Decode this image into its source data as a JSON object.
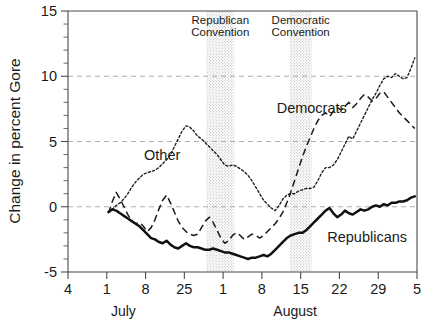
{
  "chart_data": {
    "type": "line",
    "title": "",
    "xlabel": "",
    "ylabel": "Change in percent Gore",
    "ylim": [
      -5,
      15
    ],
    "yticks": [
      -5,
      0,
      5,
      10,
      15
    ],
    "yticklabels": [
      "-5",
      "0",
      "5",
      "10",
      "15"
    ],
    "y_minor_step": 1,
    "grid": "horizontal-dashed at 0, 5, 10",
    "gridlines": [
      0,
      5,
      10
    ],
    "legend_position": "inline-annotations",
    "xticklabels": [
      "4",
      "1",
      "8",
      "25",
      "1",
      "8",
      "15",
      "22",
      "29",
      "5"
    ],
    "xtick_days": [
      4,
      11,
      18,
      25,
      32,
      39,
      46,
      53,
      60,
      67
    ],
    "xlim_days": [
      4,
      67
    ],
    "month_labels": [
      {
        "text": "July",
        "at_day": 14
      },
      {
        "text": "August",
        "at_day": 45
      }
    ],
    "annotations": [
      {
        "name": "republican-convention",
        "lines": [
          "Republican",
          "Convention"
        ],
        "band_start_day": 29,
        "band_end_day": 34,
        "shading": "stippled"
      },
      {
        "name": "democratic-convention",
        "lines": [
          "Democratic",
          "Convention"
        ],
        "band_start_day": 44,
        "band_end_day": 48,
        "shading": "stippled"
      }
    ],
    "series": [
      {
        "name": "Other",
        "style": "dotted",
        "label_at": {
          "day": 21,
          "value": 4.0
        },
        "x": [
          11.3,
          12.0,
          12.7,
          13.4,
          14.1,
          14.8,
          15.5,
          16.2,
          16.9,
          17.6,
          18.3,
          19.0,
          19.7,
          20.4,
          21.1,
          21.8,
          22.5,
          23.2,
          23.9,
          24.6,
          25.3,
          26.0,
          26.7,
          27.4,
          28.1,
          28.8,
          29.5,
          30.2,
          30.9,
          31.6,
          32.3,
          33.0,
          33.7,
          34.4,
          35.1,
          35.8,
          36.5,
          37.2,
          37.9,
          38.6,
          39.3,
          40.0,
          40.7,
          41.4,
          42.1,
          42.8,
          43.5,
          44.2,
          44.9,
          45.6,
          46.3,
          47.0,
          47.7,
          48.4,
          49.1,
          49.8,
          50.5,
          51.2,
          51.9,
          52.6,
          53.3,
          54.0,
          54.7,
          55.4,
          56.1,
          56.8,
          57.5,
          58.2,
          58.9,
          59.6,
          60.3,
          61.0,
          61.7,
          62.4,
          63.1,
          63.8,
          64.5,
          65.2,
          65.9,
          66.6
        ],
        "y": [
          -0.4,
          -0.2,
          0.1,
          0.3,
          0.6,
          1.0,
          1.5,
          1.9,
          2.2,
          2.5,
          2.6,
          2.7,
          2.8,
          3.0,
          3.3,
          3.6,
          4.0,
          4.6,
          5.2,
          5.8,
          6.2,
          6.1,
          5.8,
          5.4,
          5.2,
          4.9,
          4.6,
          4.3,
          4.0,
          3.6,
          3.2,
          3.1,
          3.2,
          3.1,
          2.9,
          2.7,
          2.4,
          2.0,
          1.5,
          1.0,
          0.5,
          0.2,
          -0.1,
          -0.3,
          0.1,
          0.6,
          0.9,
          1.0,
          1.0,
          1.2,
          1.3,
          1.4,
          1.4,
          1.5,
          2.0,
          2.6,
          3.0,
          3.0,
          3.2,
          3.6,
          4.2,
          4.8,
          5.4,
          5.2,
          5.8,
          6.4,
          7.0,
          7.6,
          8.2,
          8.7,
          9.3,
          9.8,
          10.0,
          9.9,
          10.2,
          10.0,
          9.8,
          9.9,
          10.6,
          11.4
        ]
      },
      {
        "name": "Democrats",
        "style": "dashed",
        "label_at": {
          "day": 48,
          "value": 7.6
        },
        "x": [
          11.3,
          12.0,
          12.7,
          13.4,
          14.1,
          14.8,
          15.5,
          16.2,
          16.9,
          17.6,
          18.3,
          19.0,
          19.7,
          20.4,
          21.1,
          21.8,
          22.5,
          23.2,
          23.9,
          24.6,
          25.3,
          26.0,
          26.7,
          27.4,
          28.1,
          28.8,
          29.5,
          30.2,
          30.9,
          31.6,
          32.3,
          33.0,
          33.7,
          34.4,
          35.1,
          35.8,
          36.5,
          37.2,
          37.9,
          38.6,
          39.3,
          40.0,
          40.7,
          41.4,
          42.1,
          42.8,
          43.5,
          44.2,
          44.9,
          45.6,
          46.3,
          47.0,
          47.7,
          48.4,
          49.1,
          49.8,
          50.5,
          51.2,
          51.9,
          52.6,
          53.3,
          54.0,
          54.7,
          55.4,
          56.1,
          56.8,
          57.5,
          58.2,
          58.9,
          59.6,
          60.3,
          61.0,
          61.7,
          62.4,
          63.1,
          63.8,
          64.5,
          65.2,
          65.9,
          66.6
        ],
        "y": [
          -0.5,
          0.4,
          1.1,
          0.6,
          0.0,
          -0.6,
          -1.1,
          -1.3,
          -1.2,
          -1.5,
          -1.9,
          -1.6,
          -1.0,
          -0.2,
          0.5,
          0.9,
          0.3,
          -0.4,
          -1.1,
          -1.6,
          -1.9,
          -2.1,
          -2.2,
          -2.1,
          -1.6,
          -1.1,
          -0.8,
          -1.2,
          -1.8,
          -2.4,
          -2.8,
          -2.6,
          -2.2,
          -2.0,
          -2.2,
          -2.5,
          -2.3,
          -2.1,
          -2.2,
          -2.4,
          -2.2,
          -1.9,
          -1.6,
          -1.3,
          -0.9,
          -0.4,
          0.3,
          1.1,
          2.0,
          2.9,
          3.8,
          4.6,
          5.3,
          6.0,
          6.6,
          7.0,
          7.2,
          6.9,
          7.3,
          7.6,
          7.4,
          7.7,
          8.0,
          7.6,
          7.9,
          8.3,
          8.6,
          8.4,
          8.1,
          8.3,
          8.7,
          8.8,
          8.4,
          8.0,
          7.6,
          7.2,
          6.9,
          6.6,
          6.3,
          6.0
        ]
      },
      {
        "name": "Republicans",
        "style": "solid",
        "label_at": {
          "day": 58,
          "value": -2.3
        },
        "x": [
          11.3,
          12.0,
          12.7,
          13.4,
          14.1,
          14.8,
          15.5,
          16.2,
          16.9,
          17.6,
          18.3,
          19.0,
          19.7,
          20.4,
          21.1,
          21.8,
          22.5,
          23.2,
          23.9,
          24.6,
          25.3,
          26.0,
          26.7,
          27.4,
          28.1,
          28.8,
          29.5,
          30.2,
          30.9,
          31.6,
          32.3,
          33.0,
          33.7,
          34.4,
          35.1,
          35.8,
          36.5,
          37.2,
          37.9,
          38.6,
          39.3,
          40.0,
          40.7,
          41.4,
          42.1,
          42.8,
          43.5,
          44.2,
          44.9,
          45.6,
          46.3,
          47.0,
          47.7,
          48.4,
          49.1,
          49.8,
          50.5,
          51.2,
          51.9,
          52.6,
          53.3,
          54.0,
          54.7,
          55.4,
          56.1,
          56.8,
          57.5,
          58.2,
          58.9,
          59.6,
          60.3,
          61.0,
          61.7,
          62.4,
          63.1,
          63.8,
          64.5,
          65.2,
          65.9,
          66.6
        ],
        "y": [
          -0.4,
          -0.2,
          -0.3,
          -0.5,
          -0.7,
          -0.9,
          -1.1,
          -1.3,
          -1.5,
          -1.8,
          -2.1,
          -2.4,
          -2.5,
          -2.7,
          -2.8,
          -2.6,
          -2.9,
          -3.1,
          -3.2,
          -3.0,
          -2.8,
          -3.0,
          -3.1,
          -3.1,
          -3.2,
          -3.3,
          -3.3,
          -3.2,
          -3.3,
          -3.4,
          -3.5,
          -3.5,
          -3.6,
          -3.7,
          -3.8,
          -3.9,
          -4.0,
          -3.9,
          -3.9,
          -3.8,
          -3.7,
          -3.8,
          -3.6,
          -3.3,
          -3.0,
          -2.7,
          -2.4,
          -2.2,
          -2.1,
          -2.0,
          -2.0,
          -1.8,
          -1.5,
          -1.2,
          -0.9,
          -0.6,
          -0.3,
          -0.1,
          -0.5,
          -0.8,
          -0.6,
          -0.3,
          -0.5,
          -0.6,
          -0.4,
          -0.2,
          -0.3,
          -0.2,
          0.0,
          0.1,
          0.0,
          0.2,
          0.1,
          0.3,
          0.3,
          0.4,
          0.4,
          0.5,
          0.7,
          0.8
        ]
      }
    ]
  },
  "axes": {
    "ylabel": "Change in percent Gore"
  }
}
